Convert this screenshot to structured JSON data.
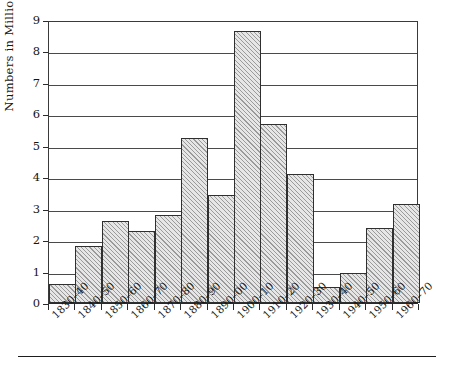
{
  "chart_data": {
    "type": "bar",
    "title": "",
    "subtitle": "",
    "xlabel": "",
    "ylabel": "Numbers in Millions",
    "ylim": [
      0,
      9
    ],
    "yticks": [
      0,
      1,
      2,
      3,
      4,
      5,
      6,
      7,
      8,
      9
    ],
    "ytick_labels": [
      "0",
      "1",
      "2",
      "3",
      "4",
      "5",
      "6",
      "7",
      "8",
      "9"
    ],
    "grid": "horizontal",
    "legend": "none",
    "annotations": [],
    "categories": [
      "1830–40",
      "1840–50",
      "1850–60",
      "1860–70",
      "1870–80",
      "1880–90",
      "1890–00",
      "1900–10",
      "1910–20",
      "1920–30",
      "1930–40",
      "1940–50",
      "1950–60",
      "1960–70"
    ],
    "values": [
      0.6,
      1.8,
      2.6,
      2.3,
      2.8,
      5.25,
      3.45,
      8.65,
      5.7,
      4.1,
      0.5,
      0.95,
      2.4,
      3.15
    ]
  },
  "style": {
    "bar_fill": "#e6e6e6",
    "bar_hatch": "diagonal",
    "bar_edge": "#2f2f2f",
    "axis_color": "#2b2b2b",
    "grid_color": "#4a4a4a",
    "background": "#ffffff",
    "text_color": "#151515"
  }
}
